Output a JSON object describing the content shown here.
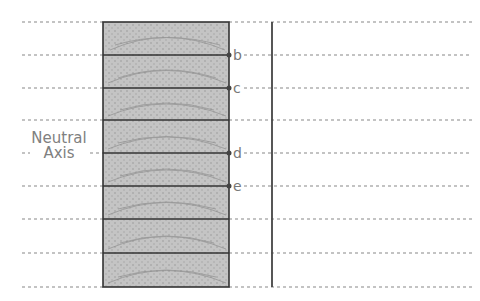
{
  "diagram": {
    "neutral_axis_label_line1": "Neutral",
    "neutral_axis_label_line2": "Axis",
    "point_labels": [
      "b",
      "c",
      "d",
      "e"
    ],
    "layers": 8,
    "colors": {
      "beam_fill": "#bdbdbd",
      "beam_border": "#333333",
      "dotted": "#888888",
      "vertical_line": "#444444",
      "label": "#777777"
    }
  }
}
